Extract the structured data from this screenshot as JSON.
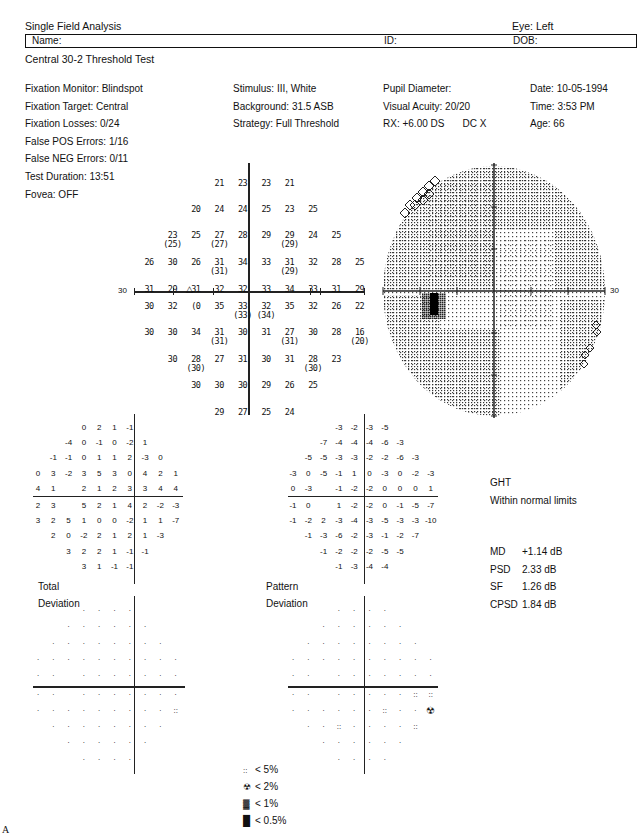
{
  "header": {
    "title": "Single Field Analysis",
    "eye": "Eye: Left",
    "name_label": "Name:",
    "id_label": "ID:",
    "dob_label": "DOB:",
    "test_name": "Central 30-2 Threshold Test"
  },
  "info": {
    "col1": [
      "Fixation Monitor: Blindspot",
      "Fixation Target: Central",
      "Fixation Losses: 0/24",
      "False POS Errors: 1/16",
      "False NEG Errors: 0/11",
      "Test Duration: 13:51"
    ],
    "fovea": "Fovea: OFF",
    "col2": [
      "Stimulus: III, White",
      "Background: 31.5 ASB",
      "Strategy: Full Threshold"
    ],
    "col3": [
      "Pupil Diameter:",
      "Visual Acuity: 20/20",
      "RX: +6.00 DS",
      "DC  X"
    ],
    "col4": [
      "Date: 10-05-1994",
      "Time:  3:53 PM",
      "Age: 66"
    ]
  },
  "threshold_axis_label_left": "30",
  "grayscale_axis_label_right": "30",
  "ght": {
    "label": "GHT",
    "value": "Within normal limits"
  },
  "indices": [
    {
      "label": "MD",
      "value": "+1.14 dB"
    },
    {
      "label": "PSD",
      "value": "2.33 dB"
    },
    {
      "label": "SF",
      "value": "1.26 dB"
    },
    {
      "label": "CPSD",
      "value": "1.84 dB"
    }
  ],
  "total_deviation_label": [
    "Total",
    "Deviation"
  ],
  "pattern_deviation_label": [
    "Pattern",
    "Deviation"
  ],
  "legend": [
    {
      "symbol": "::",
      "label": "< 5%"
    },
    {
      "symbol": "☢",
      "label": "< 2%"
    },
    {
      "symbol": "▓",
      "label": "< 1%"
    },
    {
      "symbol": "█",
      "label": "< 0.5%"
    }
  ],
  "figure_label": "A",
  "chart_data": [
    {
      "type": "table",
      "title": "Threshold values (dB), 30-2 grid",
      "rows": [
        {
          "y": 1,
          "cells": [
            [
              "21"
            ],
            [
              "23"
            ],
            [
              "23"
            ],
            [
              "21"
            ]
          ]
        },
        {
          "y": 2,
          "cells": [
            [
              "20"
            ],
            [
              "24"
            ],
            [
              "24"
            ],
            [
              "25"
            ],
            [
              "23"
            ],
            [
              "25"
            ]
          ]
        },
        {
          "y": 3,
          "cells": [
            [
              "23",
              "(25)"
            ],
            [
              "25"
            ],
            [
              "27",
              "(27)"
            ],
            [
              "28"
            ],
            [
              "29"
            ],
            [
              "29",
              "(29)"
            ],
            [
              "24"
            ],
            [
              "25"
            ]
          ]
        },
        {
          "y": 4,
          "cells": [
            [
              "26"
            ],
            [
              "30"
            ],
            [
              "26"
            ],
            [
              "31",
              "(31)"
            ],
            [
              "34"
            ],
            [
              "33"
            ],
            [
              "31",
              "(29)"
            ],
            [
              "32"
            ],
            [
              "28"
            ],
            [
              "25"
            ]
          ]
        },
        {
          "y": 5,
          "cells": [
            [
              "31"
            ],
            [
              "29"
            ],
            [
              "31"
            ],
            [
              "32"
            ],
            [
              "32"
            ],
            [
              "33"
            ],
            [
              "34"
            ],
            [
              "33"
            ],
            [
              "31"
            ],
            [
              "29"
            ]
          ]
        },
        {
          "y": 6,
          "cells": [
            [
              "30"
            ],
            [
              "32"
            ],
            [
              "(0"
            ],
            [
              "35"
            ],
            [
              "33",
              "(33)"
            ],
            [
              "32",
              "(34)"
            ],
            [
              "35"
            ],
            [
              "32"
            ],
            [
              "26"
            ],
            [
              "22"
            ]
          ]
        },
        {
          "y": 7,
          "cells": [
            [
              "30"
            ],
            [
              "30"
            ],
            [
              "34"
            ],
            [
              "31",
              "(31)"
            ],
            [
              "30"
            ],
            [
              "31"
            ],
            [
              "27",
              "(31)"
            ],
            [
              "30"
            ],
            [
              "28"
            ],
            [
              "16",
              "(20)"
            ]
          ]
        },
        {
          "y": 8,
          "cells": [
            [
              "30"
            ],
            [
              "28",
              "(30)"
            ],
            [
              "27"
            ],
            [
              "31"
            ],
            [
              "30"
            ],
            [
              "31"
            ],
            [
              "28",
              "(30)"
            ],
            [
              "23"
            ]
          ]
        },
        {
          "y": 9,
          "cells": [
            [
              "30"
            ],
            [
              "30"
            ],
            [
              "30"
            ],
            [
              "29"
            ],
            [
              "26"
            ],
            [
              "25"
            ]
          ]
        },
        {
          "y": 10,
          "cells": [
            [
              "29"
            ],
            [
              "27"
            ],
            [
              "25"
            ],
            [
              "24"
            ]
          ]
        }
      ]
    },
    {
      "type": "table",
      "title": "Total Deviation",
      "rows": [
        [
          "0",
          "2",
          "1",
          "-1"
        ],
        [
          "-4",
          "0",
          "-1",
          "0",
          "-2",
          "1"
        ],
        [
          "-1",
          "-1",
          "0",
          "1",
          "1",
          "2",
          "-3",
          "0"
        ],
        [
          "0",
          "3",
          "-2",
          "3",
          "5",
          "3",
          "0",
          "4",
          "2",
          "1"
        ],
        [
          "4",
          "1",
          "",
          "2",
          "1",
          "2",
          "3",
          "3",
          "4",
          "4"
        ],
        [
          "2",
          "3",
          "",
          "5",
          "2",
          "1",
          "4",
          "2",
          "-2",
          "-3"
        ],
        [
          "3",
          "2",
          "5",
          "1",
          "0",
          "0",
          "-2",
          "1",
          "1",
          "-7"
        ],
        [
          "2",
          "0",
          "-2",
          "2",
          "1",
          "2",
          "1",
          "-3"
        ],
        [
          "3",
          "2",
          "2",
          "1",
          "-1",
          "-1"
        ],
        [
          "3",
          "1",
          "-1",
          "-1"
        ]
      ]
    },
    {
      "type": "table",
      "title": "Pattern Deviation",
      "rows": [
        [
          "-3",
          "-2",
          "-3",
          "-5"
        ],
        [
          "-7",
          "-4",
          "-4",
          "-4",
          "-6",
          "-3"
        ],
        [
          "-5",
          "-5",
          "-3",
          "-3",
          "-2",
          "-2",
          "-6",
          "-3"
        ],
        [
          "-3",
          "0",
          "-5",
          "-1",
          "1",
          "0",
          "-3",
          "0",
          "-2",
          "-3"
        ],
        [
          "0",
          "-3",
          "",
          "-1",
          "-2",
          "-2",
          "0",
          "0",
          "0",
          "1"
        ],
        [
          "-1",
          "0",
          "",
          "1",
          "-2",
          "-2",
          "0",
          "-1",
          "-5",
          "-7"
        ],
        [
          "-1",
          "-2",
          "2",
          "-3",
          "-4",
          "-3",
          "-5",
          "-3",
          "-3",
          "-10"
        ],
        [
          "-1",
          "-3",
          "-6",
          "-2",
          "-3",
          "-1",
          "-2",
          "-7"
        ],
        [
          "-1",
          "-2",
          "-2",
          "-2",
          "-5",
          "-5"
        ],
        [
          "-1",
          "-3",
          "-4",
          "-4"
        ]
      ]
    }
  ]
}
